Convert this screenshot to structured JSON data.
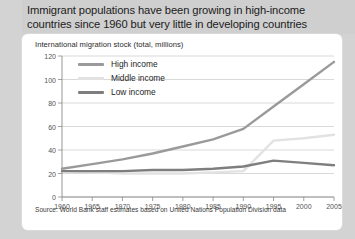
{
  "header": {
    "title": "Immigrant populations have been growing in high-income\ncountries since 1960 but very little in developing countries"
  },
  "card": {
    "subtitle": "International migration stock (total, millions)",
    "source": "Source: World Bank staff estimates based on United Nations Population Division data"
  },
  "colors": {
    "high_income": "#9a9a9a",
    "middle_income": "#e2e2e2",
    "low_income": "#7e7e7e",
    "gridline": "#c9c9c9",
    "axis": "#8a8a8a",
    "card_bg": "#ffffff",
    "header_bg": "#cfcfcf",
    "page_bg": "#d3d3d3"
  },
  "chart_data": {
    "type": "line",
    "title": "International migration stock (total, millions)",
    "xlabel": "",
    "ylabel": "",
    "x": [
      1960,
      1965,
      1970,
      1975,
      1980,
      1985,
      1990,
      1995,
      2000,
      2005
    ],
    "xlim": [
      1960,
      2005
    ],
    "ylim": [
      0,
      120
    ],
    "yticks": [
      0,
      20,
      40,
      60,
      80,
      100,
      120
    ],
    "xticks": [
      1960,
      1965,
      1970,
      1975,
      1980,
      1985,
      1990,
      1995,
      2000,
      2005
    ],
    "grid": true,
    "legend_position": "top-left",
    "series": [
      {
        "name": "High income",
        "color": "#9a9a9a",
        "values": [
          24,
          28,
          32,
          37,
          43,
          49,
          58,
          77,
          96,
          115
        ]
      },
      {
        "name": "Middle income",
        "color": "#e2e2e2",
        "values": [
          22,
          21,
          20,
          20,
          20,
          21,
          22,
          48,
          50,
          53
        ]
      },
      {
        "name": "Low income",
        "color": "#7e7e7e",
        "values": [
          22,
          22,
          22,
          23,
          23,
          24,
          26,
          31,
          29,
          27
        ]
      }
    ]
  },
  "legend": [
    {
      "label": "High income",
      "color": "#9a9a9a"
    },
    {
      "label": "Middle income",
      "color": "#e2e2e2"
    },
    {
      "label": "Low income",
      "color": "#7e7e7e"
    }
  ]
}
